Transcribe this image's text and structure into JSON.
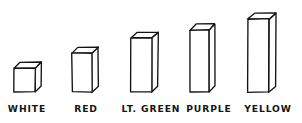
{
  "chart_data": {
    "type": "bar",
    "title": "",
    "subtitle": "",
    "xlabel": "",
    "ylabel": "",
    "style": "hand-drawn 3D isometric bars, black ink on white paper",
    "grid": false,
    "legend": null,
    "axis_visible": false,
    "tick_labels_y": [],
    "categories": [
      "WHITE",
      "RED",
      "LT. GREEN",
      "PURPLE",
      "YELLOW"
    ],
    "values": [
      24,
      39,
      54,
      62,
      73
    ],
    "ylim": [
      0,
      80
    ],
    "bars": [
      {
        "label": "WHITE",
        "value": 24,
        "front_left_x": 14,
        "front_right_x": 35,
        "top_y": 68,
        "base_y": 92,
        "depth_x": 6,
        "depth_y": 6,
        "label_x": 27,
        "label_y": 112
      },
      {
        "label": "RED",
        "value": 39,
        "front_left_x": 72,
        "front_right_x": 92,
        "top_y": 53,
        "base_y": 92,
        "depth_x": 6,
        "depth_y": 6,
        "label_x": 86,
        "label_y": 112
      },
      {
        "label": "LT. GREEN",
        "value": 54,
        "front_left_x": 131,
        "front_right_x": 152,
        "top_y": 38,
        "base_y": 92,
        "depth_x": 6,
        "depth_y": 6,
        "label_x": 151,
        "label_y": 112
      },
      {
        "label": "PURPLE",
        "value": 62,
        "front_left_x": 190,
        "front_right_x": 209,
        "top_y": 30,
        "base_y": 92,
        "depth_x": 6,
        "depth_y": 6,
        "label_x": 209,
        "label_y": 112
      },
      {
        "label": "YELLOW",
        "value": 73,
        "front_left_x": 248,
        "front_right_x": 269,
        "top_y": 19,
        "base_y": 92,
        "depth_x": 7,
        "depth_y": 6,
        "label_x": 268,
        "label_y": 112
      }
    ],
    "colors": {
      "ink": "#141414",
      "paper": "#ffffff",
      "bar_face": "#ffffff",
      "bar_side": "#fdfdfd"
    }
  }
}
